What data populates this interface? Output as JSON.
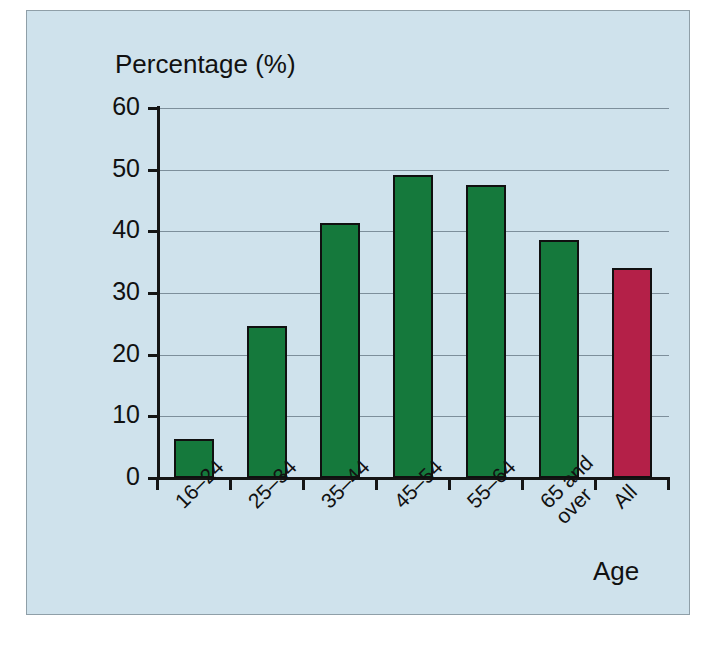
{
  "figure": {
    "background_color": "#CFE2EC",
    "frame_color": "#8F9FA8"
  },
  "chart_data": {
    "type": "bar",
    "title": "",
    "subtitle": "",
    "xlabel": "Age",
    "ylabel": "Percentage (%)",
    "categories": [
      "16–24",
      "25–34",
      "35–44",
      "45–54",
      "55–64",
      "65 and\nover",
      "All"
    ],
    "values": [
      6.4,
      24.6,
      41.4,
      49.2,
      47.5,
      38.6,
      34.1
    ],
    "bar_colors": [
      "#15793C",
      "#15793C",
      "#15793C",
      "#15793C",
      "#15793C",
      "#15793C",
      "#B42048"
    ],
    "bar_edge_color": "#101010",
    "ylim": [
      0,
      60
    ],
    "yticks": [
      0,
      10,
      20,
      30,
      40,
      50,
      60
    ],
    "ytick_labels": [
      "0",
      "10",
      "20",
      "30",
      "40",
      "50",
      "60"
    ],
    "grid": true,
    "gridline_color": "#7D8F9B",
    "legend": false,
    "legend_position": "none",
    "xtick_label_rotation": -45,
    "annotations": []
  }
}
